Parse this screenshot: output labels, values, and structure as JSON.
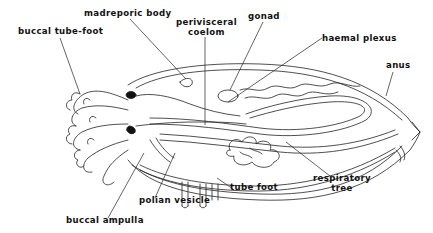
{
  "figure": {
    "colors": {
      "ink": "#111111",
      "background": "#ffffff"
    },
    "labels": [
      {
        "id": "madreporic-body",
        "lines": [
          "madreporic body"
        ]
      },
      {
        "id": "buccal-tube-foot",
        "lines": [
          "buccal tube-foot"
        ]
      },
      {
        "id": "perivisceral-coelom",
        "lines": [
          "perivisceral",
          "coelom"
        ]
      },
      {
        "id": "gonad",
        "lines": [
          "gonad"
        ]
      },
      {
        "id": "haemal-plexus",
        "lines": [
          "haemal plexus"
        ]
      },
      {
        "id": "anus",
        "lines": [
          "anus"
        ]
      },
      {
        "id": "respiratory-tree",
        "lines": [
          "respiratory",
          "tree"
        ]
      },
      {
        "id": "tube-foot",
        "lines": [
          "tube foot"
        ]
      },
      {
        "id": "polian-vesicle",
        "lines": [
          "polian vesicle"
        ]
      },
      {
        "id": "buccal-ampulla",
        "lines": [
          "buccal ampulla"
        ]
      }
    ]
  }
}
